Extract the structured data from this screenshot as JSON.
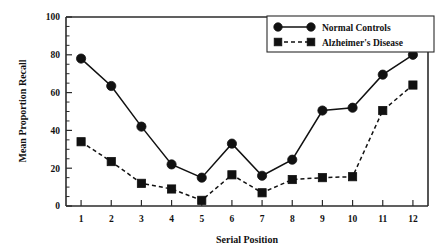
{
  "chart_data": {
    "type": "line",
    "title": "",
    "xlabel": "Serial Position",
    "ylabel": "Mean Proportion Recall",
    "categories": [
      "1",
      "2",
      "3",
      "4",
      "5",
      "6",
      "7",
      "8",
      "9",
      "10",
      "11",
      "12"
    ],
    "x": [
      1,
      2,
      3,
      4,
      5,
      6,
      7,
      8,
      9,
      10,
      11,
      12
    ],
    "xlim": [
      0.5,
      12.5
    ],
    "ylim": [
      0,
      100
    ],
    "ytick_labels": [
      "0",
      "20",
      "40",
      "60",
      "80",
      "100"
    ],
    "yticks": [
      0,
      20,
      40,
      60,
      80,
      100
    ],
    "y_minor_tick_interval": 5,
    "grid": false,
    "legend_position": "top-right",
    "series": [
      {
        "name": "Normal Controls",
        "marker": "circle",
        "line_style": "solid",
        "color": "#111111",
        "values": [
          78,
          63.5,
          42,
          22,
          15,
          33,
          16,
          24.5,
          50.5,
          52,
          69.5,
          80
        ]
      },
      {
        "name": "Alzheimer's Disease",
        "marker": "square",
        "line_style": "dashed",
        "color": "#111111",
        "values": [
          34,
          23.5,
          12,
          9,
          3,
          16.5,
          7,
          14,
          15,
          15.5,
          50.5,
          64
        ]
      }
    ]
  },
  "legend": {
    "entries": [
      {
        "label": "Normal Controls"
      },
      {
        "label": "Alzheimer's Disease"
      }
    ]
  },
  "axes": {
    "x_title": "Serial Position",
    "y_title": "Mean Proportion Recall"
  }
}
